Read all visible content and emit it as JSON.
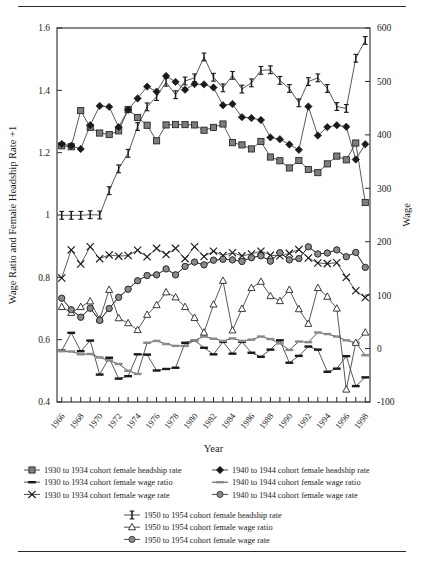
{
  "figure": {
    "rules": [
      "top-rule",
      "bottom-rule"
    ]
  },
  "chart_data": {
    "type": "line",
    "title": "",
    "xlabel": "Year",
    "ylabel": "Wage Ratio and Female Headship Rate +1",
    "y2label": "Wage",
    "grid": false,
    "legend_position": "bottom",
    "xlim": [
      1965.5,
      1998.5
    ],
    "ylim": [
      0.4,
      1.6
    ],
    "y2lim": [
      -100,
      600
    ],
    "yticks": [
      "0.4",
      "0.6",
      "0.8",
      "1",
      "1.2",
      "1.4",
      "1.6"
    ],
    "ytick_values": [
      0.4,
      0.6,
      0.8,
      1.0,
      1.2,
      1.4,
      1.6
    ],
    "y2ticks": [
      "-100",
      "0",
      "100",
      "200",
      "300",
      "400",
      "500",
      "600"
    ],
    "y2tick_values": [
      -100,
      0,
      100,
      200,
      300,
      400,
      500,
      600
    ],
    "xticks": [
      "1966",
      "1968",
      "1970",
      "1972",
      "1974",
      "1976",
      "1978",
      "1980",
      "1982",
      "1984",
      "1986",
      "1988",
      "1990",
      "1992",
      "1994",
      "1996",
      "1998"
    ],
    "xtick_values": [
      1966,
      1968,
      1970,
      1972,
      1974,
      1976,
      1978,
      1980,
      1982,
      1984,
      1986,
      1988,
      1990,
      1992,
      1994,
      1996,
      1998
    ],
    "x": [
      1966,
      1967,
      1968,
      1969,
      1970,
      1971,
      1972,
      1973,
      1974,
      1975,
      1976,
      1977,
      1978,
      1979,
      1980,
      1981,
      1982,
      1983,
      1984,
      1985,
      1986,
      1987,
      1988,
      1989,
      1990,
      1991,
      1992,
      1993,
      1994,
      1995,
      1996,
      1997,
      1998
    ],
    "series": [
      {
        "name": "1930 to 1934 cohort female headship rate",
        "key": "c30_headship",
        "axis": "left",
        "marker": "square",
        "marker_color": "#7d7d7d",
        "line_color": "#3a3a3a",
        "values": [
          1.222,
          1.219,
          1.335,
          1.281,
          1.263,
          1.258,
          1.27,
          1.338,
          1.313,
          1.288,
          1.238,
          1.289,
          1.29,
          1.29,
          1.289,
          1.272,
          1.281,
          1.292,
          1.232,
          1.225,
          1.212,
          1.236,
          1.186,
          1.174,
          1.151,
          1.175,
          1.146,
          1.136,
          1.164,
          1.189,
          1.177,
          1.231,
          1.04
        ]
      },
      {
        "name": "1930 to 1934 cohort female wage ratio",
        "key": "c30_wage_ratio",
        "axis": "left",
        "marker": "hbar",
        "marker_color": "#1a1a1a",
        "line_color": "#3a3a3a",
        "values": [
          0.565,
          0.622,
          0.563,
          0.597,
          0.488,
          0.542,
          0.475,
          0.483,
          0.553,
          0.552,
          0.501,
          0.506,
          0.51,
          0.59,
          0.598,
          0.574,
          0.553,
          0.593,
          0.555,
          0.593,
          0.558,
          0.545,
          0.568,
          0.598,
          0.526,
          0.548,
          0.578,
          0.568,
          0.497,
          0.507,
          0.547,
          0.451,
          0.479
        ]
      },
      {
        "name": "1930 to 1934 cohort female wage rate",
        "key": "c30_wage_rate",
        "axis": "left",
        "marker": "cross",
        "marker_color": "#1a1a1a",
        "line_color": "#3a3a3a",
        "values": [
          0.798,
          0.888,
          0.843,
          0.898,
          0.86,
          0.872,
          0.868,
          0.87,
          0.887,
          0.866,
          0.893,
          0.873,
          0.893,
          0.86,
          0.898,
          0.867,
          0.884,
          0.87,
          0.879,
          0.869,
          0.875,
          0.884,
          0.871,
          0.869,
          0.877,
          0.889,
          0.862,
          0.846,
          0.844,
          0.847,
          0.8,
          0.757,
          0.735
        ]
      },
      {
        "name": "1940 to 1944 cohort female headship rate",
        "key": "c40_headship",
        "axis": "left",
        "marker": "diamond",
        "marker_color": "#1a1a1a",
        "line_color": "#3a3a3a",
        "values": [
          1.228,
          1.222,
          1.212,
          1.288,
          1.35,
          1.347,
          1.282,
          1.338,
          1.374,
          1.412,
          1.396,
          1.446,
          1.427,
          1.402,
          1.42,
          1.419,
          1.409,
          1.352,
          1.356,
          1.314,
          1.311,
          1.305,
          1.249,
          1.243,
          1.226,
          1.209,
          1.348,
          1.255,
          1.282,
          1.288,
          1.283,
          1.178,
          1.227
        ]
      },
      {
        "name": "1940 to 1944 cohort female wage ratio",
        "key": "c40_wage_ratio",
        "axis": "left",
        "marker": "hbar",
        "marker_color": "#8a8a8a",
        "line_color": "#3a3a3a",
        "values": [
          0.563,
          0.562,
          0.553,
          0.554,
          0.543,
          0.533,
          0.522,
          0.5,
          0.49,
          0.59,
          0.596,
          0.586,
          0.58,
          0.58,
          0.598,
          0.61,
          0.603,
          0.596,
          0.604,
          0.596,
          0.6,
          0.61,
          0.602,
          0.588,
          0.567,
          0.594,
          0.592,
          0.623,
          0.618,
          0.61,
          0.598,
          0.59,
          0.55
        ]
      },
      {
        "name": "1940 to 1944 cohort female wage rate",
        "key": "c40_wage_rate",
        "axis": "left",
        "marker": "circle",
        "marker_color": "#8a8a8a",
        "line_color": "#3a3a3a",
        "values": [
          0.733,
          0.696,
          0.672,
          0.701,
          0.662,
          0.7,
          0.736,
          0.762,
          0.789,
          0.806,
          0.808,
          0.827,
          0.808,
          0.835,
          0.849,
          0.84,
          0.855,
          0.858,
          0.856,
          0.851,
          0.863,
          0.869,
          0.852,
          0.879,
          0.856,
          0.86,
          0.898,
          0.875,
          0.878,
          0.888,
          0.866,
          0.88,
          0.832
        ]
      },
      {
        "name": "1950 to 1954 cohort female headship rate",
        "key": "c50_headship",
        "axis": "left",
        "marker": "ibeam",
        "marker_color": "#1a1a1a",
        "line_color": "#3a3a3a",
        "values": [
          0.999,
          0.999,
          0.999,
          1.001,
          1.0,
          1.078,
          1.148,
          1.198,
          1.284,
          1.347,
          1.38,
          1.426,
          1.386,
          1.43,
          1.44,
          1.507,
          1.442,
          1.408,
          1.448,
          1.404,
          1.424,
          1.464,
          1.466,
          1.432,
          1.406,
          1.36,
          1.428,
          1.44,
          1.406,
          1.348,
          1.342,
          1.503,
          1.56
        ]
      },
      {
        "name": "1950 to 1954 cohort female wage ratio",
        "key": "c50_wage_ratio",
        "axis": "left",
        "marker": "triangle",
        "marker_color": "#ffffff",
        "line_color": "#3a3a3a",
        "values": [
          0.705,
          0.686,
          0.705,
          0.723,
          0.665,
          0.76,
          0.669,
          0.653,
          0.631,
          0.68,
          0.711,
          0.752,
          0.736,
          0.705,
          0.67,
          0.623,
          0.713,
          0.789,
          0.63,
          0.699,
          0.766,
          0.786,
          0.74,
          0.724,
          0.76,
          0.698,
          0.651,
          0.766,
          0.738,
          0.7,
          0.44,
          0.59,
          0.623
        ]
      },
      {
        "name": "1950 to 1954 cohort female wage rate",
        "key": "c50_wage_rate",
        "axis": "left",
        "marker": "circle",
        "marker_color": "#8a8a8a",
        "line_color": "#3a3a3a",
        "values": [
          0.733,
          0.696,
          0.672,
          0.701,
          0.662,
          0.7,
          0.736,
          0.762,
          0.789,
          0.806,
          0.808,
          0.827,
          0.808,
          0.835,
          0.849,
          0.84,
          0.855,
          0.858,
          0.856,
          0.851,
          0.863,
          0.869,
          0.852,
          0.879,
          0.856,
          0.86,
          0.898,
          0.875,
          0.878,
          0.888,
          0.866,
          0.88,
          0.832
        ]
      }
    ]
  },
  "legend": {
    "rows": [
      {
        "left": {
          "marker": "square",
          "marker_color": "#7d7d7d",
          "label": "1930 to 1934 cohort female headship rate"
        },
        "right": {
          "marker": "diamond",
          "marker_color": "#1a1a1a",
          "label": "1940 to 1944 cohort female headship rate"
        }
      },
      {
        "left": {
          "marker": "hbar",
          "marker_color": "#1a1a1a",
          "label": "1930 to 1934 cohort female wage ratio"
        },
        "right": {
          "marker": "hbar",
          "marker_color": "#8a8a8a",
          "label": "1940 to 1944 cohort female wage ratio"
        }
      },
      {
        "left": {
          "marker": "cross",
          "marker_color": "#1a1a1a",
          "label": "1930 to 1934 cohort female wage rate"
        },
        "right": {
          "marker": "circle",
          "marker_color": "#8a8a8a",
          "label": "1940 to 1944 cohort female wage rate"
        }
      }
    ],
    "bottom_rows": [
      {
        "marker": "ibeam",
        "marker_color": "#1a1a1a",
        "label": "1950 to 1954 cohort female headship rate"
      },
      {
        "marker": "triangle",
        "marker_color": "#ffffff",
        "label": "1950 to 1954 cohort female wage ratio"
      },
      {
        "marker": "circle",
        "marker_color": "#8a8a8a",
        "label": "1950 to 1954 cohort female wage rate"
      }
    ]
  },
  "colors": {
    "ink": "#1a1a1a",
    "line": "#3a3a3a",
    "gray_marker": "#7d7d7d",
    "gray_marker_light": "#8a8a8a",
    "open_marker_fill": "#ffffff"
  }
}
